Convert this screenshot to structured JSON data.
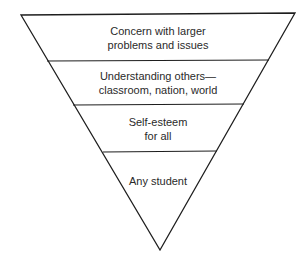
{
  "diagram": {
    "type": "inverted-triangle-hierarchy",
    "colors": {
      "stroke": "#1e1e1e",
      "text": "#2a2a2a",
      "background": "#ffffff"
    },
    "levels": [
      {
        "line1": "Concern with larger",
        "line2": "problems and issues"
      },
      {
        "line1": "Understanding others—",
        "line2": "classroom, nation, world"
      },
      {
        "line1": "Self-esteem",
        "line2": "for all"
      },
      {
        "line1": "Any student",
        "line2": ""
      }
    ]
  }
}
